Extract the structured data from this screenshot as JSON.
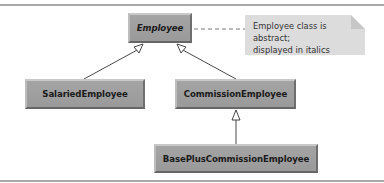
{
  "diagram": {
    "type": "UML class diagram",
    "classes": [
      {
        "id": "employee",
        "name": "Employee",
        "abstract": true
      },
      {
        "id": "salaried",
        "name": "SalariedEmployee",
        "abstract": false
      },
      {
        "id": "commission",
        "name": "CommissionEmployee",
        "abstract": false
      },
      {
        "id": "basePlus",
        "name": "BasePlusCommissionEmployee",
        "abstract": false
      }
    ],
    "generalizations": [
      {
        "from": "SalariedEmployee",
        "to": "Employee"
      },
      {
        "from": "CommissionEmployee",
        "to": "Employee"
      },
      {
        "from": "BasePlusCommissionEmployee",
        "to": "CommissionEmployee"
      }
    ],
    "note": {
      "line1": "Employee class is abstract;",
      "line2": "displayed in italics",
      "attached_to": "Employee"
    }
  },
  "colors": {
    "class_fill": "#a0a0a0",
    "note_fill": "#dcdcdc",
    "line": "#333333",
    "frame": "#a9a9a9"
  }
}
